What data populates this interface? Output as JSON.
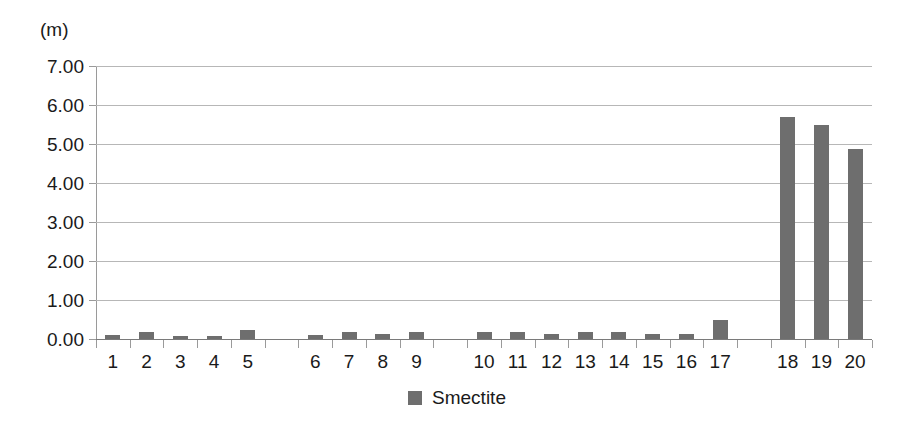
{
  "chart_data": {
    "type": "bar",
    "title": "",
    "subtitle": "",
    "xlabel": "",
    "ylabel": "(m)",
    "unit_label": "(m)",
    "ylim": [
      0.0,
      7.0
    ],
    "ytick_step": 1.0,
    "ytick_labels": [
      "7.00",
      "6.00",
      "5.00",
      "4.00",
      "3.00",
      "2.00",
      "1.00",
      "0.00"
    ],
    "ytick_values": [
      7.0,
      6.0,
      5.0,
      4.0,
      3.0,
      2.0,
      1.0,
      0.0
    ],
    "grid": true,
    "grid_axis": "y",
    "legend": [
      "Smectite"
    ],
    "legend_position": "bottom-center",
    "categories": [
      "1",
      "2",
      "3",
      "4",
      "5",
      "6",
      "7",
      "8",
      "9",
      "10",
      "11",
      "12",
      "13",
      "14",
      "15",
      "16",
      "17",
      "18",
      "19",
      "20"
    ],
    "series": [
      {
        "name": "Smectite",
        "color": "#6e6e6e",
        "values": [
          0.1,
          0.17,
          0.09,
          0.08,
          0.22,
          0.1,
          0.17,
          0.14,
          0.18,
          0.18,
          0.18,
          0.14,
          0.18,
          0.17,
          0.13,
          0.14,
          0.5,
          5.7,
          5.5,
          4.87
        ]
      }
    ],
    "group_breaks_after": [
      "5",
      "9",
      "17"
    ]
  },
  "legend": {
    "swatch_name": "legend-color-swatch",
    "label": "Smectite"
  },
  "axis": {
    "unit": "(m)"
  }
}
